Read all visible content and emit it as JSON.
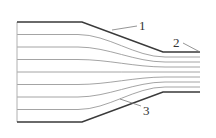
{
  "diagram": {
    "type": "converging-nozzle-streamlines",
    "colors": {
      "wall": "#3a3a3a",
      "streamline": "#9a9a9a",
      "inlet": "#b0b0b0",
      "leader": "#7a7a7a",
      "label": "#333333"
    },
    "geometry": {
      "inlet_x": 17,
      "taper_start_x": 82,
      "taper_end_x": 163,
      "outlet_x": 200,
      "inlet_top_y": 22,
      "inlet_bottom_y": 122,
      "outlet_top_y": 52,
      "outlet_bottom_y": 92,
      "interior_streamline_count": 7
    },
    "labels": [
      {
        "id": "1",
        "text": "1",
        "x": 139,
        "y": 30,
        "leader": [
          112,
          30,
          137,
          26
        ]
      },
      {
        "id": "2",
        "text": "2",
        "x": 173,
        "y": 47,
        "leader": [
          183,
          43,
          200,
          52
        ]
      },
      {
        "id": "3",
        "text": "3",
        "x": 143,
        "y": 115,
        "leader": [
          120,
          99,
          141,
          106
        ]
      }
    ]
  }
}
